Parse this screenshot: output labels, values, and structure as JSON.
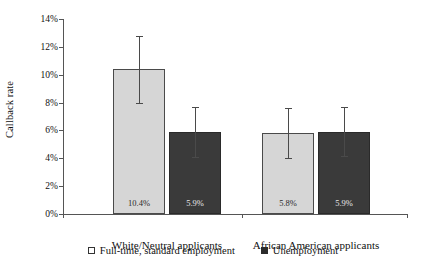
{
  "chart_data": {
    "type": "bar",
    "title": "",
    "xlabel": "",
    "ylabel": "Callback rate",
    "ylim": [
      0,
      14
    ],
    "ytick_labels": [
      "0%",
      "2%",
      "4%",
      "6%",
      "8%",
      "10%",
      "12%",
      "14%"
    ],
    "ytick_values": [
      0,
      2,
      4,
      6,
      8,
      10,
      12,
      14
    ],
    "grid": false,
    "legend_position": "bottom",
    "categories": [
      "White/Neutral applicants",
      "African American applicants"
    ],
    "series": [
      {
        "name": "Full-time, standard employment",
        "color": "#d6d6d6",
        "values": [
          10.4,
          5.8
        ],
        "value_labels": [
          "10.4%",
          "5.8%"
        ],
        "error_low": [
          8.0,
          4.0
        ],
        "error_high": [
          12.8,
          7.6
        ]
      },
      {
        "name": "Unemployment",
        "color": "#3a3a3a",
        "values": [
          5.9,
          5.9
        ],
        "value_labels": [
          "5.9%",
          "5.9%"
        ],
        "error_low": [
          4.1,
          4.2
        ],
        "error_high": [
          7.7,
          7.7
        ]
      }
    ]
  },
  "legend": {
    "items": [
      {
        "label": "Full-time, standard employment",
        "swatch": "light-square-icon"
      },
      {
        "label": "Unemployment",
        "swatch": "dark-square-icon"
      }
    ]
  },
  "axis": {
    "y_title": "Callback rate"
  }
}
